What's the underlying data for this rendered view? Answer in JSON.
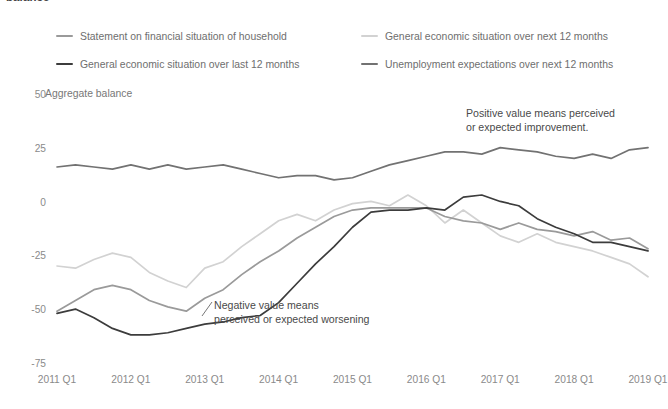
{
  "clipped_title": "balance",
  "axis": {
    "y_title": "Aggregate balance",
    "y_ticks": [
      "50",
      "25",
      "0",
      "-25",
      "-50",
      "-75"
    ],
    "x_ticks": [
      "2011 Q1",
      "2012 Q1",
      "2013 Q1",
      "2014 Q1",
      "2015 Q1",
      "2016 Q1",
      "2017 Q1",
      "2018 Q1",
      "2019 Q1"
    ]
  },
  "legend": {
    "items": [
      {
        "label": "Statement on financial situation of household",
        "color": "#9a9a9a"
      },
      {
        "label": "General economic situation over next 12 months",
        "color": "#d2d2d2"
      },
      {
        "label": "General economic situation over last 12 months",
        "color": "#3c3c3c"
      },
      {
        "label": "Unemployment expectations over next 12 months",
        "color": "#727272"
      }
    ]
  },
  "annotations": {
    "positive": "Positive value means perceived\nor expected improvement.",
    "negative": "Negative value means\nperceived or expected worsening"
  },
  "chart_data": {
    "type": "line",
    "title": "Aggregate balance",
    "xlabel": "",
    "ylabel": "Aggregate balance",
    "ylim": [
      -75,
      50
    ],
    "grid": false,
    "legend_position": "top",
    "x": [
      "2011 Q1",
      "2011 Q2",
      "2011 Q3",
      "2011 Q4",
      "2012 Q1",
      "2012 Q2",
      "2012 Q3",
      "2012 Q4",
      "2013 Q1",
      "2013 Q2",
      "2013 Q3",
      "2013 Q4",
      "2014 Q1",
      "2014 Q2",
      "2014 Q3",
      "2014 Q4",
      "2015 Q1",
      "2015 Q2",
      "2015 Q3",
      "2015 Q4",
      "2016 Q1",
      "2016 Q2",
      "2016 Q3",
      "2016 Q4",
      "2017 Q1",
      "2017 Q2",
      "2017 Q3",
      "2017 Q4",
      "2018 Q1",
      "2018 Q2",
      "2018 Q3",
      "2018 Q4",
      "2019 Q1"
    ],
    "series": [
      {
        "name": "Unemployment expectations over next 12 months",
        "color": "#727272",
        "values": [
          17,
          18,
          17,
          16,
          18,
          16,
          18,
          16,
          17,
          18,
          16,
          14,
          12,
          13,
          13,
          11,
          12,
          15,
          18,
          20,
          22,
          24,
          24,
          23,
          26,
          25,
          24,
          22,
          21,
          23,
          21,
          25,
          26
        ]
      },
      {
        "name": "General economic situation over next 12 months",
        "color": "#d2d2d2",
        "values": [
          -29,
          -30,
          -26,
          -23,
          -25,
          -32,
          -36,
          -39,
          -30,
          -27,
          -20,
          -14,
          -8,
          -5,
          -8,
          -3,
          0,
          1,
          -1,
          4,
          -1,
          -9,
          -3,
          -9,
          -15,
          -18,
          -14,
          -18,
          -20,
          -22,
          -25,
          -28,
          -34
        ]
      },
      {
        "name": "Statement on financial situation of household",
        "color": "#9a9a9a",
        "values": [
          -50,
          -45,
          -40,
          -38,
          -40,
          -45,
          -48,
          -50,
          -44,
          -40,
          -33,
          -27,
          -22,
          -16,
          -11,
          -6,
          -3,
          -2,
          -2,
          -2,
          -2,
          -6,
          -8,
          -9,
          -12,
          -9,
          -12,
          -13,
          -15,
          -13,
          -17,
          -16,
          -21
        ]
      },
      {
        "name": "General economic situation over last 12 months",
        "color": "#3c3c3c",
        "values": [
          -51,
          -49,
          -53,
          -58,
          -61,
          -61,
          -60,
          -58,
          -56,
          -55,
          -53,
          -52,
          -46,
          -37,
          -28,
          -20,
          -11,
          -4,
          -3,
          -3,
          -2,
          -3,
          3,
          4,
          1,
          -1,
          -7,
          -11,
          -14,
          -18,
          -18,
          -20,
          -22
        ]
      }
    ],
    "plot_series_order": [
      "General economic situation over next 12 months",
      "Statement on financial situation of household",
      "General economic situation over last 12 months",
      "Unemployment expectations over next 12 months"
    ]
  },
  "plot_geometry": {
    "x0": 57,
    "x1": 648,
    "y_top_value": 50,
    "y_top_px": 96,
    "y_bottom_value": -75,
    "y_bottom_px": 365
  }
}
